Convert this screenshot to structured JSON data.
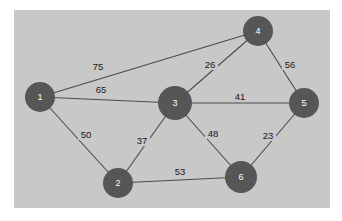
{
  "figure": {
    "type": "weighted-undirected-graph",
    "canvas": {
      "x": 14,
      "y": 10,
      "width": 316,
      "height": 198,
      "background_color": "#c8c8c8",
      "page_background_color": "#ffffff"
    },
    "style": {
      "node_fill": "#565656",
      "node_label_color": "#ffffff",
      "edge_color": "#4a4a4a",
      "edge_label_color": "#181818"
    }
  },
  "nodes": [
    {
      "id": "1",
      "label": "1",
      "x": 40,
      "y": 97,
      "r": 15
    },
    {
      "id": "2",
      "label": "2",
      "x": 118,
      "y": 183,
      "r": 15
    },
    {
      "id": "3",
      "label": "3",
      "x": 175,
      "y": 103,
      "r": 17
    },
    {
      "id": "4",
      "label": "4",
      "x": 258,
      "y": 31,
      "r": 15
    },
    {
      "id": "5",
      "label": "5",
      "x": 304,
      "y": 103,
      "r": 15
    },
    {
      "id": "6",
      "label": "6",
      "x": 241,
      "y": 177,
      "r": 16
    }
  ],
  "edges": [
    {
      "from": "1",
      "to": "4",
      "weight": "75",
      "lx": 98,
      "ly": 66
    },
    {
      "from": "1",
      "to": "3",
      "weight": "65",
      "lx": 101,
      "ly": 89
    },
    {
      "from": "1",
      "to": "2",
      "weight": "50",
      "lx": 86,
      "ly": 134
    },
    {
      "from": "2",
      "to": "3",
      "weight": "37",
      "lx": 142,
      "ly": 140
    },
    {
      "from": "2",
      "to": "6",
      "weight": "53",
      "lx": 180,
      "ly": 171
    },
    {
      "from": "3",
      "to": "4",
      "weight": "26",
      "lx": 210,
      "ly": 64
    },
    {
      "from": "3",
      "to": "5",
      "weight": "41",
      "lx": 240,
      "ly": 96
    },
    {
      "from": "3",
      "to": "6",
      "weight": "48",
      "lx": 213,
      "ly": 133
    },
    {
      "from": "4",
      "to": "5",
      "weight": "56",
      "lx": 290,
      "ly": 64
    },
    {
      "from": "5",
      "to": "6",
      "weight": "23",
      "lx": 268,
      "ly": 135
    }
  ]
}
